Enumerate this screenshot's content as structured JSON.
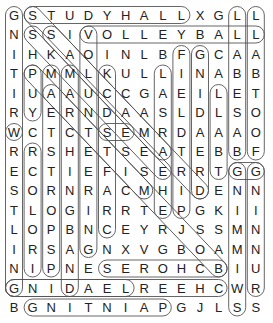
{
  "puzzle": {
    "rows": [
      "GSTUDYHALLXGLL",
      "NSSIVOLLEYBALL",
      "IHKAOINLBFGCAA",
      "TPMMLKULLINABB",
      "IUAAUCCGAEILET",
      "RYERNDAASLDLSO",
      "WCTCTSEMRDAAAO",
      "RRSHETSEATEBBF",
      "ECTIEFISERRTGG",
      "SORNRACMHIDENN",
      "TLOGIRRTEPGKII",
      "LOPBNCEYRJSSMN",
      "IRSAGNXVGBOAMN",
      "NIPNESEROHCBIU",
      "GNIDAELREEHCWR",
      "BGNITNIAPGJLSS"
    ],
    "colors": {
      "letter": "#222222",
      "loop": "#555555"
    },
    "loops": [
      {
        "word": "WRITING",
        "r1": 0,
        "c1": 0,
        "r2": 6,
        "c2": 0
      },
      {
        "word": "WRESTLING",
        "r1": 6,
        "c1": 0,
        "r2": 14,
        "c2": 0
      },
      {
        "word": "STUDYHALL",
        "r1": 0,
        "c1": 1,
        "r2": 0,
        "c2": 9
      },
      {
        "word": "VOLLEYBALL",
        "r1": 1,
        "c1": 4,
        "r2": 1,
        "c2": 13
      },
      {
        "word": "BASEBALL",
        "r1": 0,
        "c1": 12,
        "r2": 7,
        "c2": 12
      },
      {
        "word": "SWIMMING",
        "r1": 8,
        "c1": 12,
        "r2": 15,
        "c2": 12
      },
      {
        "word": "FOOTBALL",
        "r1": 0,
        "c1": 13,
        "r2": 7,
        "c2": 13
      },
      {
        "word": "RUNNING",
        "r1": 8,
        "c1": 13,
        "r2": 14,
        "c2": 13
      },
      {
        "word": "PAINTING",
        "r1": 15,
        "c1": 1,
        "r2": 15,
        "c2": 8
      },
      {
        "word": "LEADING",
        "r1": 14,
        "c1": 0,
        "r2": 14,
        "c2": 6
      },
      {
        "word": "CHEERLEADING",
        "r1": 14,
        "c1": 0,
        "r2": 14,
        "c2": 11
      },
      {
        "word": "CHORES",
        "r1": 13,
        "c1": 5,
        "r2": 13,
        "c2": 11
      },
      {
        "word": "VOLUNTEERING",
        "r1": 1,
        "c1": 4,
        "r2": 12,
        "c2": 4
      },
      {
        "word": "LIBRARY",
        "r1": 3,
        "c1": 8,
        "r2": 10,
        "c2": 8
      },
      {
        "word": "FISHING",
        "r1": 2,
        "c1": 9,
        "r2": 10,
        "c2": 9
      },
      {
        "word": "GAMING",
        "r1": 2,
        "c1": 10,
        "r2": 9,
        "c2": 10
      },
      {
        "word": "LABEL",
        "r1": 4,
        "c1": 11,
        "r2": 8,
        "c2": 11
      },
      {
        "word": "PUMA",
        "r1": 3,
        "c1": 1,
        "r2": 5,
        "c2": 1
      },
      {
        "word": "MARCHING",
        "r1": 3,
        "c1": 2,
        "r2": 13,
        "c2": 2
      },
      {
        "word": "MARCHING2",
        "r1": 3,
        "c1": 3,
        "r2": 14,
        "c2": 3
      },
      {
        "word": "CLUB",
        "r1": 3,
        "c1": 5,
        "r2": 11,
        "c2": 5
      },
      {
        "word": "CRAFTS",
        "r1": 7,
        "c1": 1,
        "r2": 13,
        "c2": 1
      },
      {
        "word": "DIAG1",
        "r1": 0,
        "c1": 1,
        "r2": 9,
        "c2": 10
      },
      {
        "word": "DIAG2",
        "r1": 1,
        "c1": 1,
        "r2": 8,
        "c2": 8
      },
      {
        "word": "DIAG3",
        "r1": 3,
        "c1": 1,
        "r2": 13,
        "c2": 11
      },
      {
        "word": "DIAG4",
        "r1": 1,
        "c1": 2,
        "r2": 7,
        "c2": 8
      },
      {
        "word": "DIAG5",
        "r1": 4,
        "c1": 2,
        "r2": 9,
        "c2": 7
      },
      {
        "word": "SEAS",
        "r1": 6,
        "c1": 5,
        "r2": 6,
        "c2": 6
      },
      {
        "word": "GG",
        "r1": 8,
        "c1": 12,
        "r2": 8,
        "c2": 13
      }
    ]
  }
}
